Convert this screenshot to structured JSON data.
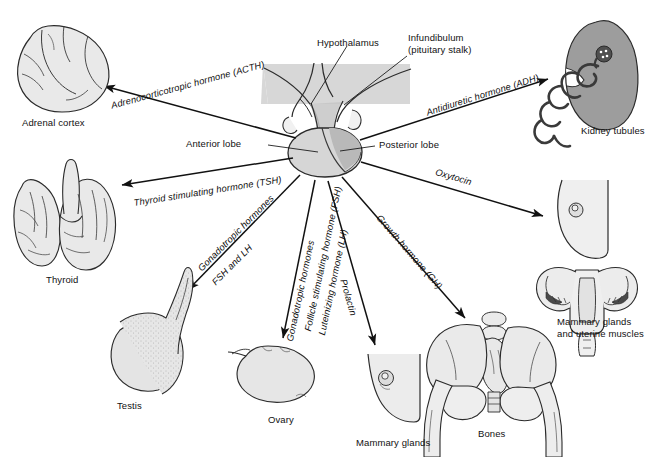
{
  "diagram": {
    "background_color": "#ffffff",
    "ink_color": "#111111",
    "fill_light": "#e3e3e3",
    "fill_mid": "#cfcfcf",
    "fill_dark": "#9a9a9a",
    "brain_band_color": "#d5d5d5"
  },
  "callouts": {
    "hypothalamus": "Hypothalamus",
    "infundibulum_line1": "Infundibulum",
    "infundibulum_line2": "(pituitary stalk)",
    "anterior_lobe": "Anterior lobe",
    "posterior_lobe": "Posterior lobe"
  },
  "hormones": [
    {
      "id": "acth",
      "label": "Adrenocorticotropic hormone (ACTH)",
      "target": "Adrenal cortex"
    },
    {
      "id": "tsh",
      "label": "Thyroid stimulating hormone (TSH)",
      "target": "Thyroid"
    },
    {
      "id": "gonadotropic-male-1",
      "label": "Gonadotropic hormones",
      "target": "Testis"
    },
    {
      "id": "gonadotropic-male-2",
      "label": "FSH and LH",
      "target": "Testis"
    },
    {
      "id": "gonadotropic-female-1",
      "label": "Gonadotropic hormones",
      "target": "Ovary"
    },
    {
      "id": "fsh",
      "label": "Follicle stimulating hormone (FSH)",
      "target": "Ovary"
    },
    {
      "id": "lh",
      "label": "Luteinizing hormone (LH)",
      "target": "Ovary"
    },
    {
      "id": "prolactin",
      "label": "Prolactin",
      "target": "Mammary glands"
    },
    {
      "id": "gh",
      "label": "Growth hormone (GH)",
      "target": "Bones"
    },
    {
      "id": "oxytocin",
      "label": "Oxytocin",
      "target": "Mammary glands and uterine muscles"
    },
    {
      "id": "adh",
      "label": "Antidiuretic hormone (ADH)",
      "target": "Kidney tubules"
    }
  ],
  "organs": [
    {
      "id": "adrenal-cortex",
      "label": "Adrenal cortex"
    },
    {
      "id": "thyroid",
      "label": "Thyroid"
    },
    {
      "id": "testis",
      "label": "Testis"
    },
    {
      "id": "ovary",
      "label": "Ovary"
    },
    {
      "id": "mammary-glands",
      "label": "Mammary glands"
    },
    {
      "id": "bones",
      "label": "Bones"
    },
    {
      "id": "mammary-uterine",
      "label": "Mammary glands\nand uterine muscles"
    },
    {
      "id": "kidney-tubules",
      "label": "Kidney tubules"
    }
  ]
}
